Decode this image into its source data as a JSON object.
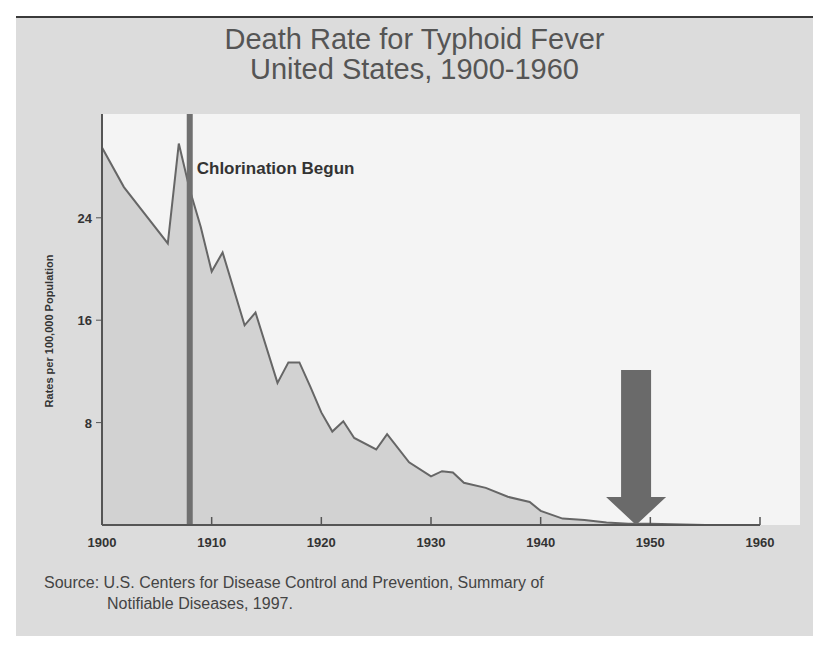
{
  "chart_data": {
    "type": "area",
    "title": "Death Rate for Typhoid Fever",
    "subtitle": "United States, 1900-1960",
    "xlabel": "",
    "ylabel": "Rates per 100,000 Population",
    "xlim": [
      1900,
      1960
    ],
    "ylim": [
      0,
      30
    ],
    "x_ticks": [
      1900,
      1910,
      1920,
      1930,
      1940,
      1950,
      1960
    ],
    "y_ticks": [
      8,
      16,
      24
    ],
    "grid": false,
    "legend": null,
    "series": [
      {
        "name": "Typhoid fever death rate",
        "x": [
          1900,
          1902,
          1906,
          1907,
          1908,
          1909,
          1910,
          1911,
          1913,
          1914,
          1916,
          1917,
          1918,
          1919,
          1920,
          1921,
          1922,
          1923,
          1925,
          1926,
          1928,
          1930,
          1931,
          1932,
          1933,
          1935,
          1937,
          1939,
          1940,
          1942,
          1944,
          1946,
          1948,
          1950,
          1955,
          1960
        ],
        "values": [
          29.5,
          26.4,
          22.0,
          29.8,
          26.2,
          23.3,
          19.8,
          21.3,
          15.6,
          16.6,
          11.1,
          12.7,
          12.7,
          10.8,
          8.8,
          7.3,
          8.1,
          6.8,
          5.9,
          7.1,
          4.9,
          3.8,
          4.2,
          4.1,
          3.3,
          2.9,
          2.2,
          1.8,
          1.1,
          0.5,
          0.4,
          0.2,
          0.1,
          0.1,
          0.0,
          0.0
        ]
      }
    ],
    "annotations": [
      {
        "type": "vertical-line",
        "x": 1908,
        "label": "Chlorination Begun"
      },
      {
        "type": "down-arrow",
        "x": 1948.7,
        "label": ""
      }
    ]
  },
  "title": {
    "line1": "Death Rate for Typhoid Fever",
    "line2": "United States, 1900-1960"
  },
  "axis": {
    "ylabel": "Rates per 100,000 Population",
    "x_tick_labels": [
      "1900",
      "1910",
      "1920",
      "1930",
      "1940",
      "1950",
      "1960"
    ],
    "y_tick_labels": [
      "8",
      "16",
      "24"
    ]
  },
  "annotation": {
    "chlorination_label": "Chlorination Begun"
  },
  "source": {
    "line1": "Source: U.S. Centers for Disease Control and Prevention, Summary of",
    "line2": "Notifiable Diseases, 1997."
  },
  "colors": {
    "background": "#dcdcdc",
    "plot_area": "#f4f4f4",
    "area_fill": "#d2d2d2",
    "line": "#666666",
    "vline": "#707070",
    "arrow": "#6a6a6a",
    "axis": "#555555"
  }
}
